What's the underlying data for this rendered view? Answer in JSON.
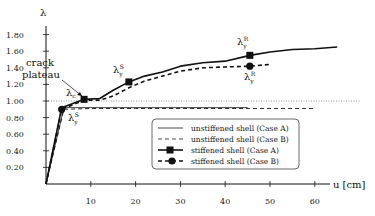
{
  "chart_data": {
    "type": "line",
    "title": "",
    "xlabel": "u [cm]",
    "ylabel": "λ",
    "xlim": [
      0,
      65
    ],
    "ylim": [
      0,
      1.9
    ],
    "x_ticks": [
      10,
      20,
      30,
      40,
      50,
      60
    ],
    "y_ticks": [
      "0.20",
      "0.40",
      "0.60",
      "0.80",
      "1.00",
      "1.20",
      "1.40",
      "1.60",
      "1.80"
    ],
    "grid": false,
    "reference_line": {
      "y": 1.0,
      "style": "dotted"
    },
    "legend_position": "lower right",
    "series": [
      {
        "name": "unstiffened shell (Case A)",
        "style": "solid",
        "x": [
          0,
          4,
          10,
          20,
          30,
          40,
          45
        ],
        "y": [
          0,
          0.92,
          0.92,
          0.92,
          0.92,
          0.92,
          0.92
        ]
      },
      {
        "name": "unstiffened shell (Case B)",
        "style": "dashed",
        "x": [
          0,
          4,
          10,
          20,
          30,
          40,
          50,
          60
        ],
        "y": [
          0,
          0.9,
          0.91,
          0.91,
          0.91,
          0.91,
          0.91,
          0.91
        ]
      },
      {
        "name": "stiffened shell (Case A)",
        "style": "solid-square",
        "x": [
          0,
          3.5,
          8.5,
          12,
          15,
          18.5,
          22,
          26,
          30,
          35,
          40,
          45.5,
          50,
          55,
          60,
          65
        ],
        "y": [
          0,
          0.92,
          1.02,
          1.03,
          1.13,
          1.23,
          1.3,
          1.35,
          1.42,
          1.46,
          1.48,
          1.55,
          1.59,
          1.62,
          1.63,
          1.65
        ]
      },
      {
        "name": "stiffened shell (Case B)",
        "style": "dashed-circle",
        "x": [
          0,
          3.5,
          8.5,
          12,
          15,
          18.5,
          22,
          26,
          30,
          35,
          40,
          45.5,
          50
        ],
        "y": [
          0,
          0.9,
          1.01,
          1.01,
          1.06,
          1.16,
          1.24,
          1.3,
          1.36,
          1.4,
          1.41,
          1.42,
          1.44
        ]
      }
    ],
    "annotations": [
      {
        "text": "crack plateau",
        "x": 10,
        "y": 1.3
      },
      {
        "text": "λc",
        "x": 7,
        "y": 1.1
      },
      {
        "text": "λyS",
        "x": 5.5,
        "y": 0.78
      },
      {
        "text": "λyS",
        "x": 17,
        "y": 1.36
      },
      {
        "text": "λyR",
        "x": 44,
        "y": 1.68
      },
      {
        "text": "λyR",
        "x": 45.5,
        "y": 1.27
      }
    ]
  },
  "labels": {
    "ylabel": "λ",
    "xlabel": "u [cm]",
    "crack1": "crack",
    "crack2": "plateau",
    "lam": "λ",
    "sub_c": "c",
    "sub_y": "y",
    "sup_S": "S",
    "sup_R": "R"
  },
  "legend": [
    "unstiffened shell (Case A)",
    "unstiffened shell (Case B)",
    "stiffened shell (Case A)",
    "stiffened shell (Case B)"
  ]
}
